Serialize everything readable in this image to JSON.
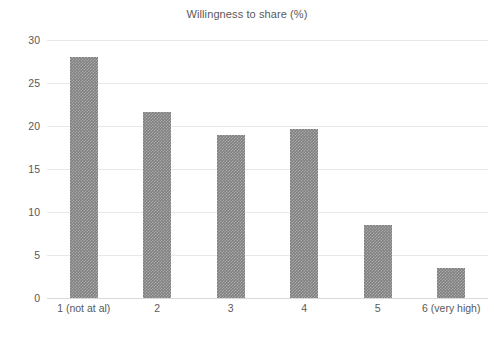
{
  "chart_data": {
    "type": "bar",
    "title": "Willingness to share (%)",
    "xlabel": "",
    "ylabel": "",
    "categories": [
      "1 (not at al)",
      "2",
      "3",
      "4",
      "5",
      "6 (very high)"
    ],
    "values": [
      28.0,
      21.6,
      18.9,
      19.6,
      8.5,
      3.5
    ],
    "ylim": [
      0,
      30
    ],
    "yticks": [
      0,
      5,
      10,
      15,
      20,
      25,
      30
    ],
    "ytick_labels": [
      "0",
      "5",
      "10",
      "15",
      "20",
      "25",
      "30"
    ],
    "grid": true,
    "legend": false,
    "series": [
      {
        "name": "Willingness to share (%)",
        "values": [
          28.0,
          21.6,
          18.9,
          19.6,
          8.5,
          3.5
        ]
      }
    ]
  },
  "style": {
    "bar_color": "#7f7f7f",
    "gridline_color": "#e8e8e8",
    "axis_color": "#d9d9d9",
    "text_color": "#595959",
    "background": "#ffffff"
  }
}
